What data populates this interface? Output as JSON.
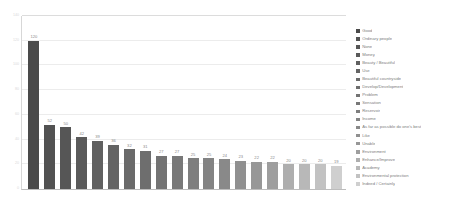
{
  "chart_data": {
    "type": "bar",
    "title": "",
    "xlabel": "",
    "ylabel": "",
    "ylim": [
      0,
      140
    ],
    "ytick_interval": 20,
    "yticks": [
      0,
      20,
      40,
      60,
      80,
      100,
      120,
      140
    ],
    "ytick_labels": [
      "0",
      "20",
      "40",
      "60",
      "80",
      "100",
      "120",
      "140"
    ],
    "grid": true,
    "legend_position": "right",
    "categories": [
      "Good",
      "Ordinary people",
      "None",
      "Money",
      "Beauty / Beautiful",
      "Use",
      "Beautiful countryside",
      "Develop/Development",
      "Problem",
      "Sensation",
      "Reservoir",
      "Income",
      "As far as possible do one's best",
      "Like",
      "Unable",
      "Environment",
      "Enhance/Improve",
      "Academy",
      "Environmental protection",
      "Indeed / Certainly"
    ],
    "values": [
      120,
      52,
      50,
      42,
      39,
      36,
      32,
      31,
      27,
      27,
      25,
      25,
      24,
      23,
      22,
      22,
      20,
      20,
      20,
      19
    ],
    "value_labels": [
      "120",
      "52",
      "50",
      "42",
      "39",
      "36",
      "32",
      "31",
      "27",
      "27",
      "25",
      "25",
      "24",
      "23",
      "22",
      "22",
      "20",
      "20",
      "20",
      "19"
    ],
    "bar_colors": [
      "#4a4a4a",
      "#525252",
      "#565656",
      "#5a5a5a",
      "#606060",
      "#646464",
      "#6a6a6a",
      "#6e6e6e",
      "#737373",
      "#787878",
      "#7e7e7e",
      "#838383",
      "#898989",
      "#909090",
      "#979797",
      "#9e9e9e",
      "#aeaeae",
      "#b8b8b8",
      "#c2c2c2",
      "#cfcfcf"
    ],
    "axis_color": "#bdbdbd",
    "gridline_color": "#ececec",
    "value_label_color": "#8a8a8a",
    "legend_text_color": "#7d7d7d",
    "background": "#ffffff"
  }
}
